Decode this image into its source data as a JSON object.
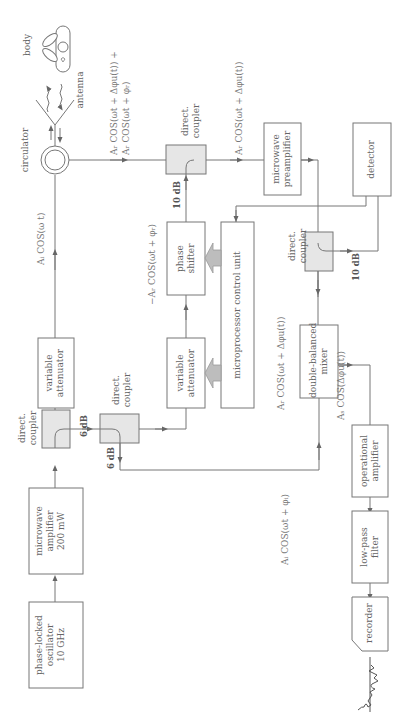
{
  "diagram": {
    "orientation": "rotated 90deg counter-clockwise",
    "blocks": {
      "oscillator": [
        "phase-locked",
        "oscillator",
        "10 GHz"
      ],
      "mw_amplifier": [
        "microwave",
        "amplifier",
        "200 mW"
      ],
      "coupler1": [
        "direct.",
        "coupler"
      ],
      "var_att1": [
        "variable",
        "attenuator"
      ],
      "coupler2": [
        "direct.",
        "coupler"
      ],
      "var_att2": [
        "variable",
        "attenuator"
      ],
      "phase_shifter": [
        "phase",
        "shifter"
      ],
      "mcu": "microprocessor control unit",
      "circulator": "circulator",
      "antenna": "antenna",
      "body": "body",
      "coupler3": [
        "direct.",
        "coupler"
      ],
      "preamp": [
        "microwave",
        "preamplifier"
      ],
      "detector": "detector",
      "coupler4": [
        "direct.",
        "coupler"
      ],
      "mixer": [
        "double-balanced",
        "mixer"
      ],
      "opamp": [
        "operational",
        "amplifier"
      ],
      "lpf": [
        "low-pass",
        "filter"
      ],
      "recorder": "recorder"
    },
    "gains": {
      "c1_out": "6 dB",
      "c2_out": "6 dB",
      "c3_in": "10 dB",
      "c4_out": "10 dB"
    },
    "signals": {
      "tx": "Aᵢ COS(ω t)",
      "rx_line1": "Aᵣ COS(ωt + Δφu(t)) +",
      "rx_line2": "Aᵣ COS(ωt + φᵣ)",
      "cancel": "−Aᵣ COS(ωt + φᵣ)",
      "clean": "Aᵣ COS(ωt + Δφu(t))",
      "mixer_in": "Aᵣ COS(ωt + Δφu(t))",
      "lo": "Aᵢ COS(ωt + φᵢ)",
      "baseband": "Aₛ COS(Δφu(t))"
    }
  }
}
